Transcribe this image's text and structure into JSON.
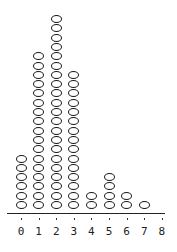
{
  "chart_data": {
    "type": "dot",
    "title": "",
    "xlabel": "",
    "ylabel": "",
    "categories": [
      "0",
      "1",
      "2",
      "3",
      "4",
      "5",
      "6",
      "7",
      "8"
    ],
    "values": [
      6,
      17,
      21,
      15,
      2,
      4,
      2,
      1,
      0
    ],
    "xlim": [
      0,
      8
    ],
    "grid": false,
    "legend": null,
    "marker": "hollow-ellipse"
  }
}
